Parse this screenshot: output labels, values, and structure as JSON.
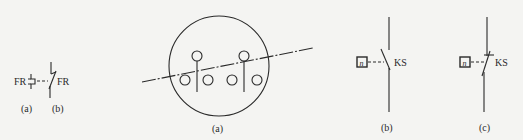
{
  "figure_left": {
    "symbol_a_label": "FR",
    "symbol_b_label": "FR",
    "caption_a": "(a)",
    "caption_b": "(b)"
  },
  "figure_middle": {
    "caption": "(a)"
  },
  "figure_right": {
    "panel_b": {
      "relay_box_text": "n",
      "contact_label": "KS",
      "caption": "(b)"
    },
    "panel_c": {
      "relay_box_text": "n",
      "contact_label": "KS",
      "caption": "(c)"
    }
  },
  "colors": {
    "stroke": "#2a2a2a",
    "background": "#f4f4f2"
  }
}
